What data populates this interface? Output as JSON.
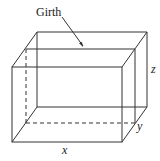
{
  "diagram": {
    "title": "Girth",
    "labels": {
      "girth": "Girth",
      "x": "x",
      "y": "y",
      "z": "z"
    },
    "stroke_color": "#333333"
  }
}
